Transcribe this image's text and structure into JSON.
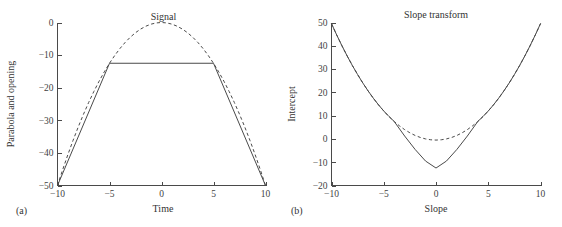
{
  "figure": {
    "panels": [
      {
        "tag": "(a)",
        "title": "Signal",
        "xlabel": "Time",
        "ylabel": "Parabola and opening"
      },
      {
        "tag": "(b)",
        "title": "Slope transform",
        "xlabel": "Slope",
        "ylabel": "Intercept"
      }
    ]
  },
  "chart_data": [
    {
      "type": "line",
      "title": "Signal",
      "xlabel": "Time",
      "ylabel": "Parabola and opening",
      "panel_tag": "(a)",
      "xlim": [
        -10,
        10
      ],
      "ylim": [
        -50,
        0
      ],
      "xticks": [
        -10,
        -5,
        0,
        5,
        10
      ],
      "xticklabels": [
        "-10",
        "-5",
        "0",
        "5",
        "10"
      ],
      "yticks": [
        0,
        -10,
        -20,
        -30,
        -40,
        -50
      ],
      "yticklabels": [
        "0",
        "-10",
        "-20",
        "-30",
        "-40",
        "-50"
      ],
      "grid": false,
      "legend": "none",
      "annotations": [
        {
          "text": "Signal",
          "x": 0,
          "y": 3
        }
      ],
      "series": [
        {
          "name": "parabola",
          "style": "dashed",
          "comment": "y = -x^2/2 over x in [-10,10]",
          "x": [
            -10,
            -9.5,
            -9,
            -8.5,
            -8,
            -7.5,
            -7,
            -6.5,
            -6,
            -5.5,
            -5,
            -4.5,
            -4,
            -3.5,
            -3,
            -2.5,
            -2,
            -1.5,
            -1,
            -0.5,
            0,
            0.5,
            1,
            1.5,
            2,
            2.5,
            3,
            3.5,
            4,
            4.5,
            5,
            5.5,
            6,
            6.5,
            7,
            7.5,
            8,
            8.5,
            9,
            9.5,
            10
          ],
          "y": [
            -50,
            -45.13,
            -40.5,
            -36.13,
            -32,
            -28.13,
            -24.5,
            -21.13,
            -18,
            -15.13,
            -12.5,
            -10.13,
            -8,
            -6.13,
            -4.5,
            -3.13,
            -2,
            -1.13,
            -0.5,
            -0.13,
            0,
            -0.13,
            -0.5,
            -1.13,
            -2,
            -3.13,
            -4.5,
            -6.13,
            -8,
            -10.13,
            -12.5,
            -15.13,
            -18,
            -21.13,
            -24.5,
            -28.13,
            -32,
            -36.13,
            -40.5,
            -45.13,
            -50
          ]
        },
        {
          "name": "opening",
          "style": "solid",
          "comment": "morphological opening: linear flanks tangent at x=+/-5, flat top at -12.5",
          "x": [
            -10,
            -5,
            5,
            10
          ],
          "y": [
            -50,
            -12.5,
            -12.5,
            -50
          ]
        }
      ]
    },
    {
      "type": "line",
      "title": "Slope transform",
      "xlabel": "Slope",
      "ylabel": "Intercept",
      "panel_tag": "(b)",
      "xlim": [
        -10,
        10
      ],
      "ylim": [
        -20,
        50
      ],
      "xticks": [
        -10,
        -5,
        0,
        5,
        10
      ],
      "xticklabels": [
        "-10",
        "-5",
        "0",
        "5",
        "10"
      ],
      "yticks": [
        50,
        40,
        30,
        20,
        10,
        0,
        -10,
        -20
      ],
      "yticklabels": [
        "50",
        "40",
        "30",
        "20",
        "10",
        "0",
        "-10",
        "-20"
      ],
      "grid": false,
      "legend": "none",
      "annotations": [],
      "series": [
        {
          "name": "parabola-transform",
          "style": "dashed",
          "comment": "y = s^2/2 - 0.5 ; slope transform of the parabola, shallow dish near 0",
          "x": [
            -10,
            -9.5,
            -9,
            -8.5,
            -8,
            -7.5,
            -7,
            -6.5,
            -6,
            -5.5,
            -5,
            -4.5,
            -4,
            -3.5,
            -3,
            -2.5,
            -2,
            -1.5,
            -1,
            -0.5,
            0,
            0.5,
            1,
            1.5,
            2,
            2.5,
            3,
            3.5,
            4,
            4.5,
            5,
            5.5,
            6,
            6.5,
            7,
            7.5,
            8,
            8.5,
            9,
            9.5,
            10
          ],
          "y": [
            49.5,
            44.63,
            40,
            35.63,
            31.5,
            27.63,
            24,
            20.63,
            17.5,
            14.63,
            12,
            9.63,
            7.5,
            5.63,
            4,
            2.63,
            1.5,
            0.63,
            0,
            -0.37,
            -0.5,
            -0.37,
            0,
            0.63,
            1.5,
            2.63,
            4,
            5.63,
            7.5,
            9.63,
            12,
            14.63,
            17.5,
            20.63,
            24,
            27.63,
            31.5,
            35.63,
            40,
            44.63,
            49.5
          ]
        },
        {
          "name": "opening-transform",
          "style": "solid",
          "comment": "V-shaped for |s|<=4 meeting -12.5 at s=0, merging with parabola transform beyond |s|~4",
          "x": [
            -10,
            -9.5,
            -9,
            -8.5,
            -8,
            -7.5,
            -7,
            -6.5,
            -6,
            -5.5,
            -5,
            -4.5,
            -4,
            -3,
            -2,
            -1,
            0,
            1,
            2,
            3,
            4,
            4.5,
            5,
            5.5,
            6,
            6.5,
            7,
            7.5,
            8,
            8.5,
            9,
            9.5,
            10
          ],
          "y": [
            49.5,
            44.63,
            40,
            35.63,
            31.5,
            27.63,
            24,
            20.63,
            17.5,
            14.63,
            12,
            9.63,
            7.5,
            1.25,
            -4.5,
            -9.5,
            -12.5,
            -9.5,
            -4.5,
            1.25,
            7.5,
            9.63,
            12,
            14.63,
            17.5,
            20.63,
            24,
            27.63,
            31.5,
            35.63,
            40,
            44.63,
            49.5
          ]
        }
      ]
    }
  ]
}
